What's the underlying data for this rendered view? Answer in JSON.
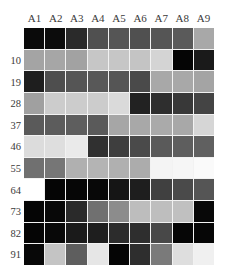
{
  "chart_data": {
    "type": "heatmap",
    "title": "",
    "xlabel": "",
    "ylabel": "",
    "colormap": "grayscale",
    "legend": null,
    "columns": [
      "A1",
      "A2",
      "A3",
      "A4",
      "A5",
      "A6",
      "A7",
      "A8",
      "A9"
    ],
    "rows": [
      "",
      "10",
      "19",
      "28",
      "37",
      "46",
      "55",
      "64",
      "73",
      "82",
      "91"
    ],
    "values_gray": [
      [
        10,
        12,
        42,
        80,
        85,
        80,
        85,
        90,
        168
      ],
      [
        164,
        166,
        162,
        198,
        198,
        196,
        212,
        5,
        26
      ],
      [
        30,
        78,
        85,
        88,
        85,
        74,
        168,
        168,
        164
      ],
      [
        160,
        204,
        204,
        204,
        218,
        34,
        46,
        56,
        68
      ],
      [
        90,
        92,
        94,
        90,
        166,
        168,
        170,
        168,
        214
      ],
      [
        220,
        222,
        234,
        48,
        62,
        74,
        90,
        94,
        96
      ],
      [
        112,
        118,
        176,
        180,
        176,
        172,
        244,
        246,
        250
      ],
      [
        255,
        5,
        6,
        8,
        21,
        30,
        64,
        74,
        85
      ],
      [
        5,
        8,
        42,
        112,
        140,
        189,
        190,
        192,
        8
      ],
      [
        5,
        8,
        26,
        30,
        44,
        46,
        72,
        6,
        6
      ],
      [
        8,
        196,
        94,
        230,
        5,
        46,
        122,
        222,
        240
      ]
    ],
    "colors": [
      [
        "#0a0a0a",
        "#0c0c0c",
        "#2a2a2a",
        "#505050",
        "#555555",
        "#505050",
        "#555555",
        "#5a5a5a",
        "#a8a8a8"
      ],
      [
        "#a4a4a4",
        "#a6a6a6",
        "#a2a2a2",
        "#c6c6c6",
        "#c6c6c6",
        "#c4c4c4",
        "#d4d4d4",
        "#050505",
        "#1a1a1a"
      ],
      [
        "#1e1e1e",
        "#4e4e4e",
        "#555555",
        "#585858",
        "#555555",
        "#4a4a4a",
        "#a8a8a8",
        "#a8a8a8",
        "#a4a4a4"
      ],
      [
        "#a0a0a0",
        "#cccccc",
        "#cccccc",
        "#cccccc",
        "#dadada",
        "#222222",
        "#2e2e2e",
        "#383838",
        "#444444"
      ],
      [
        "#5a5a5a",
        "#5c5c5c",
        "#5e5e5e",
        "#5a5a5a",
        "#a6a6a6",
        "#a8a8a8",
        "#aaaaaa",
        "#a8a8a8",
        "#d6d6d6"
      ],
      [
        "#dcdcdc",
        "#dedede",
        "#eaeaea",
        "#303030",
        "#3e3e3e",
        "#4a4a4a",
        "#5a5a5a",
        "#5e5e5e",
        "#606060"
      ],
      [
        "#707070",
        "#767676",
        "#b0b0b0",
        "#b4b4b4",
        "#b0b0b0",
        "#acacac",
        "#f4f4f4",
        "#f6f6f6",
        "#fafafa"
      ],
      [
        "#ffffff",
        "#050505",
        "#060606",
        "#080808",
        "#151515",
        "#1e1e1e",
        "#404040",
        "#4a4a4a",
        "#555555"
      ],
      [
        "#050505",
        "#080808",
        "#2a2a2a",
        "#707070",
        "#8c8c8c",
        "#bdbdbd",
        "#bebebe",
        "#c0c0c0",
        "#080808"
      ],
      [
        "#050505",
        "#080808",
        "#1a1a1a",
        "#1e1e1e",
        "#2c2c2c",
        "#2e2e2e",
        "#484848",
        "#060606",
        "#060606"
      ],
      [
        "#080808",
        "#c4c4c4",
        "#5e5e5e",
        "#e6e6e6",
        "#050505",
        "#2e2e2e",
        "#7a7a7a",
        "#dedede",
        "#f0f0f0"
      ]
    ],
    "grid": false
  }
}
